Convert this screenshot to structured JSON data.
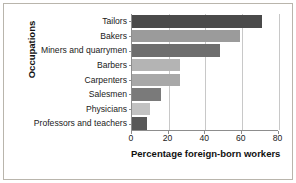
{
  "chart_data": {
    "type": "bar",
    "orientation": "horizontal",
    "title": "",
    "xlabel": "Percentage foreign-born workers",
    "ylabel": "Occupations",
    "categories": [
      "Tailors",
      "Bakers",
      "Miners and quarrymen",
      "Barbers",
      "Carpenters",
      "Salesmen",
      "Physicians",
      "Professors and teachers"
    ],
    "values": [
      71,
      59,
      48,
      26,
      26,
      16,
      10,
      8
    ],
    "bar_colors": [
      "#4a4a4a",
      "#9b9b9b",
      "#6e6e6e",
      "#b4b4b4",
      "#a8a8a8",
      "#7a7a7a",
      "#c2c2c2",
      "#585858"
    ],
    "xlim": [
      0,
      80
    ],
    "xticks": [
      0,
      20,
      40,
      60,
      80
    ],
    "xtick_labels": [
      "0",
      "20",
      "40",
      "60",
      "80"
    ],
    "grid": true,
    "grid_axis": "x",
    "legend": "none"
  },
  "figure": {
    "frame_color": "#b9b5ac",
    "axis_color": "#8d8d8d",
    "grid_color": "#c8c8c8",
    "background": "#ffffff"
  }
}
